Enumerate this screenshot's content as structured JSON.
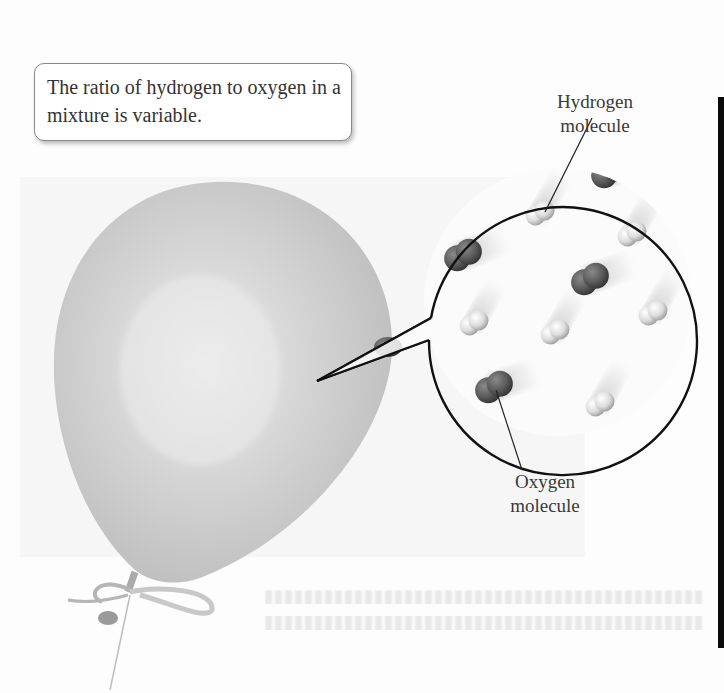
{
  "figure": {
    "callout_text": "The ratio of hydrogen to oxygen in a mixture is variable.",
    "labels": {
      "hydrogen": {
        "line1": "Hydrogen",
        "line2": "molecule"
      },
      "oxygen": {
        "line1": "Oxygen",
        "line2": "molecule"
      }
    },
    "molecules": [
      {
        "type": "hydrogen",
        "x": 540,
        "y": 213
      },
      {
        "type": "hydrogen",
        "x": 632,
        "y": 234
      },
      {
        "type": "hydrogen",
        "x": 474,
        "y": 323
      },
      {
        "type": "hydrogen",
        "x": 555,
        "y": 332
      },
      {
        "type": "hydrogen",
        "x": 653,
        "y": 313
      },
      {
        "type": "hydrogen",
        "x": 600,
        "y": 404
      },
      {
        "type": "oxygen",
        "x": 463,
        "y": 255
      },
      {
        "type": "oxygen",
        "x": 590,
        "y": 279
      },
      {
        "type": "oxygen",
        "x": 494,
        "y": 387
      },
      {
        "type": "oxygen",
        "x": 610,
        "y": 172
      }
    ],
    "colors": {
      "balloon": "#c9c9c9",
      "hydrogen_atom": "#e4e4e4",
      "oxygen_atom": "#585858",
      "outline": "#111111"
    }
  }
}
